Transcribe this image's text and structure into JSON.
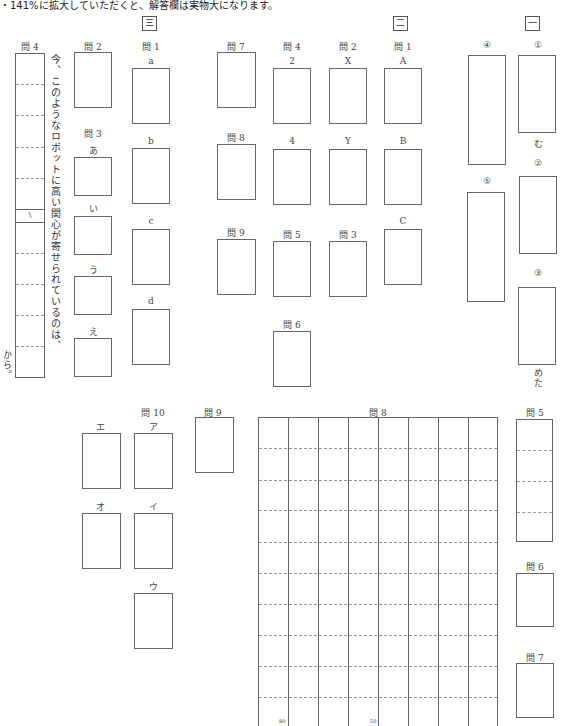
{
  "header": {
    "note": "・141%に拡大していただくと、解答欄は実物大になります。"
  },
  "sections": {
    "san": "三",
    "ni": "二",
    "ichi": "一"
  },
  "sec3": {
    "q4": {
      "label": "問 4",
      "prompt": "今、このようなロボットに高い関心が寄せられているのは、",
      "suffix": "から。",
      "mark": "\\"
    },
    "q2": {
      "label": "問 2"
    },
    "q3": {
      "label": "問 3",
      "items": [
        "あ",
        "い",
        "う",
        "え"
      ]
    },
    "q1": {
      "label": "問 1",
      "items": [
        "a",
        "b",
        "c",
        "d"
      ]
    },
    "q10": {
      "label": "問 10",
      "items": [
        "エ",
        "ア",
        "オ",
        "イ",
        "ウ"
      ]
    },
    "q9": {
      "label": "問 9"
    },
    "q8": {
      "label": "問 8",
      "marks": [
        "80",
        "50"
      ]
    },
    "q5": {
      "label": "問 5"
    },
    "q6": {
      "label": "問 6"
    },
    "q7": {
      "label": "問 7"
    }
  },
  "sec2": {
    "q7": {
      "label": "問 7"
    },
    "q4": {
      "label": "問 4",
      "items": [
        "2",
        "4"
      ]
    },
    "q2": {
      "label": "問 2",
      "items": [
        "X",
        "Y"
      ]
    },
    "q1": {
      "label": "問 1",
      "items": [
        "A",
        "B",
        "C"
      ]
    },
    "q8": {
      "label": "問 8"
    },
    "q9": {
      "label": "問 9"
    },
    "q5": {
      "label": "問 5"
    },
    "q3": {
      "label": "問 3"
    },
    "q6": {
      "label": "問 6"
    }
  },
  "sec1": {
    "items": [
      "①",
      "②",
      "③",
      "④",
      "⑤"
    ],
    "suffix1": "む",
    "suffix3": "めた"
  }
}
